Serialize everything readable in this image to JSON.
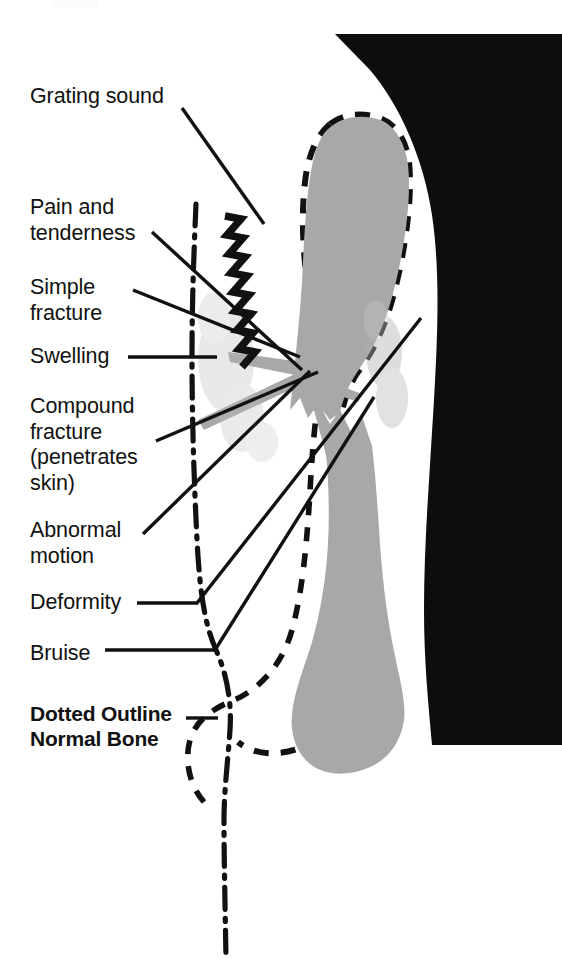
{
  "figure": {
    "background_color": "#ffffff"
  },
  "colors": {
    "ink": "#111111",
    "bone_fill": "#a8a8a8",
    "silhouette": "#0d0d0d",
    "paper": "#ffffff"
  },
  "labels": [
    {
      "id": "grating-sound",
      "text": "Grating sound",
      "x": 30,
      "y": 84,
      "bold": false
    },
    {
      "id": "pain-tenderness",
      "text": "Pain and\ntenderness",
      "x": 30,
      "y": 195,
      "bold": false
    },
    {
      "id": "simple-fracture",
      "text": "Simple\nfracture",
      "x": 30,
      "y": 275,
      "bold": false
    },
    {
      "id": "swelling",
      "text": "Swelling",
      "x": 30,
      "y": 344,
      "bold": false
    },
    {
      "id": "compound-fracture",
      "text": "Compound\nfracture\n(penetrates\nskin)",
      "x": 30,
      "y": 394,
      "bold": false
    },
    {
      "id": "abnormal-motion",
      "text": "Abnormal\nmotion",
      "x": 30,
      "y": 518,
      "bold": false
    },
    {
      "id": "deformity",
      "text": "Deformity",
      "x": 30,
      "y": 590,
      "bold": false
    },
    {
      "id": "bruise",
      "text": "Bruise",
      "x": 30,
      "y": 641,
      "bold": false
    },
    {
      "id": "dotted-outline",
      "text": "Dotted Outline\nNormal Bone",
      "x": 30,
      "y": 701,
      "bold": true
    }
  ],
  "annotations": {
    "grating_sound_symbol": "zigzag-NNNN-line",
    "normal_bone_outline_style": "dashed",
    "fractured_bone_style": "solid-gray-fill",
    "skin_contour_style": "dash-dot"
  },
  "leader_lines": [
    {
      "id": "leader-grating-sound",
      "from": [
        182,
        108
      ],
      "to": [
        262,
        222
      ]
    },
    {
      "id": "leader-pain-tenderness",
      "from": [
        152,
        232
      ],
      "to": [
        300,
        368
      ]
    },
    {
      "id": "leader-simple-fracture",
      "from": [
        133,
        290
      ],
      "to": [
        299,
        356
      ]
    },
    {
      "id": "leader-swelling",
      "from": [
        128,
        357
      ],
      "to": [
        216,
        357
      ]
    },
    {
      "id": "leader-compound-fracture",
      "from": [
        155,
        440
      ],
      "to": [
        317,
        372
      ]
    },
    {
      "id": "leader-abnormal-motion",
      "from": [
        142,
        534
      ],
      "to": [
        309,
        371
      ]
    },
    {
      "id": "leader-deformity",
      "from": [
        137,
        603
      ],
      "to": [
        196,
        603
      ]
    },
    {
      "id": "leader-deformity-diag",
      "from": [
        196,
        603
      ],
      "to": [
        420,
        318
      ]
    },
    {
      "id": "leader-bruise",
      "from": [
        105,
        650
      ],
      "to": [
        214,
        650
      ]
    },
    {
      "id": "leader-bruise-diag",
      "from": [
        214,
        650
      ],
      "to": [
        372,
        398
      ]
    },
    {
      "id": "leader-dotted-outline",
      "from": [
        186,
        718
      ],
      "to": [
        216,
        718
      ]
    }
  ]
}
